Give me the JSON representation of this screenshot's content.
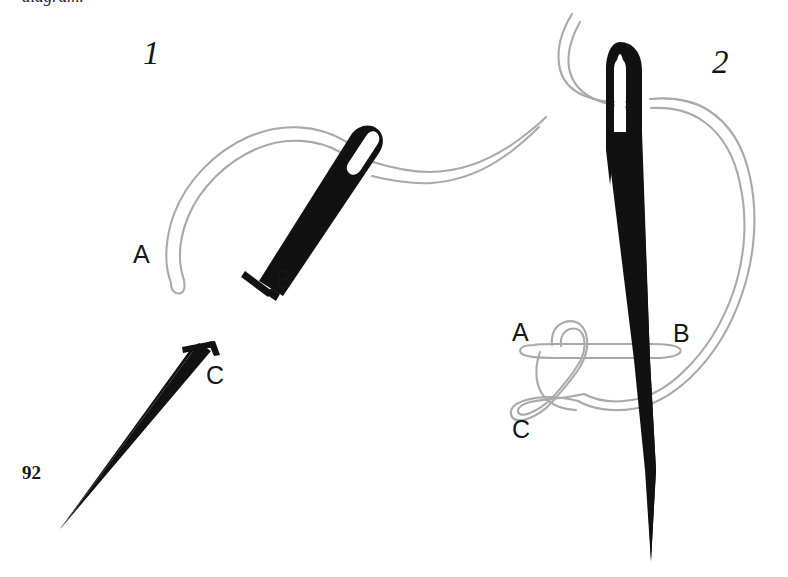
{
  "page": {
    "width": 788,
    "height": 577,
    "background_color": "#ffffff",
    "page_number": "92",
    "running_head": "diagram."
  },
  "palette": {
    "needle_black": "#111111",
    "thread_grey": "#a9a9a9",
    "ink": "#15161a",
    "paper": "#ffffff"
  },
  "steps": [
    {
      "number": "1",
      "caption_labels": [
        "A",
        "B",
        "C"
      ]
    },
    {
      "number": "2",
      "caption_labels": [
        "A",
        "B",
        "C"
      ]
    }
  ],
  "labels": {
    "step_one_number": "1",
    "step_two_number": "2",
    "step_one_point_a": "A",
    "step_one_point_b": "B",
    "step_one_point_c": "C",
    "step_two_point_a": "A",
    "step_two_point_b": "B",
    "step_two_point_c": "C",
    "folio": "92"
  },
  "figure": {
    "elements": [
      {
        "name": "step-1-needle",
        "kind": "needle",
        "orientation": "diagonal",
        "eye": "slot"
      },
      {
        "name": "step-1-thread-loop",
        "kind": "thread",
        "color": "#a9a9a9"
      },
      {
        "name": "step-1-second-needle",
        "kind": "needle",
        "orientation": "diagonal-down-left",
        "eye": "none"
      },
      {
        "name": "step-2-needle",
        "kind": "needle",
        "orientation": "vertical",
        "eye": "oval"
      },
      {
        "name": "step-2-thread-knot",
        "kind": "thread",
        "color": "#a9a9a9"
      }
    ]
  }
}
